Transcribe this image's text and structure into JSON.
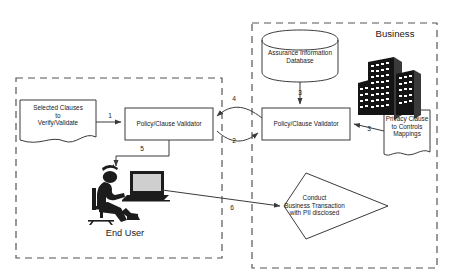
{
  "diagram": {
    "type": "process-flow",
    "zones": [
      {
        "id": "end-user",
        "label": "End User"
      },
      {
        "id": "business",
        "label": "Business"
      }
    ],
    "nodes": [
      {
        "id": "selected-clauses",
        "shape": "document",
        "label": "Selected Clauses\nto\nVerify/Validate"
      },
      {
        "id": "validator-user",
        "shape": "rectangle",
        "label": "Policy/Clause Validator"
      },
      {
        "id": "validator-business",
        "shape": "rectangle",
        "label": "Policy/Clause Validator"
      },
      {
        "id": "assurance-db",
        "shape": "cylinder",
        "label": "Assurance Information\nDatabase"
      },
      {
        "id": "privacy-mappings",
        "shape": "document",
        "label": "Privacy Clause\nto Controls\nMappings"
      },
      {
        "id": "transaction",
        "shape": "diamond",
        "label": "Conduct\nBusiness Transaction\nwith PII disclosed"
      },
      {
        "id": "end-user-actor",
        "shape": "clipart",
        "label": "End User"
      },
      {
        "id": "business-actor",
        "shape": "clipart",
        "label": "Business"
      }
    ],
    "edges": [
      {
        "id": "e1",
        "number": "1",
        "from": "selected-clauses",
        "to": "validator-user"
      },
      {
        "id": "e2",
        "number": "2",
        "from": "validator-user",
        "to": "validator-business"
      },
      {
        "id": "e3a",
        "number": "3",
        "from": "assurance-db",
        "to": "validator-business"
      },
      {
        "id": "e3b",
        "number": "3",
        "from": "privacy-mappings",
        "to": "validator-business"
      },
      {
        "id": "e4",
        "number": "4",
        "from": "validator-business",
        "to": "validator-user"
      },
      {
        "id": "e5",
        "number": "5",
        "from": "validator-user",
        "to": "end-user-actor"
      },
      {
        "id": "e6",
        "number": "6",
        "from": "end-user-actor",
        "to": "transaction"
      }
    ],
    "colors": {
      "stroke": "#3a3a3a",
      "text": "#1a1a1a",
      "background": "#ffffff",
      "clipart": "#1c1c1c",
      "zone_border": "#555555"
    }
  }
}
